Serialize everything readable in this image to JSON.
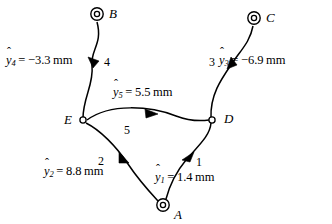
{
  "figure": {
    "background_color": "#ffffff",
    "stroke_color": "#000000",
    "width": 332,
    "height": 224
  },
  "nodes": [
    {
      "id": "B",
      "label": "B",
      "type": "ground-pivot",
      "x": 97,
      "y": 14
    },
    {
      "id": "C",
      "label": "C",
      "type": "ground-pivot",
      "x": 254,
      "y": 18
    },
    {
      "id": "E",
      "label": "E",
      "type": "pin-joint",
      "x": 83,
      "y": 120
    },
    {
      "id": "D",
      "label": "D",
      "type": "pin-joint",
      "x": 212,
      "y": 120
    },
    {
      "id": "A",
      "label": "A",
      "type": "ground-pivot",
      "x": 163,
      "y": 205
    }
  ],
  "links": [
    {
      "id": "link1",
      "number": "1",
      "from": "A",
      "to": "D",
      "value_label": {
        "var": "y",
        "sub": "1",
        "op": "=",
        "value": "1.4",
        "unit": "mm",
        "full": "y1 = 1.4 mm"
      }
    },
    {
      "id": "link2",
      "number": "2",
      "from": "A",
      "to": "E",
      "value_label": {
        "var": "y",
        "sub": "2",
        "op": "=",
        "value": "8.8",
        "unit": "mm",
        "full": "y2 = 8.8 mm"
      }
    },
    {
      "id": "link3",
      "number": "3",
      "from": "C",
      "to": "D",
      "value_label": {
        "var": "y",
        "sub": "3",
        "op": "=",
        "value": "−6.9",
        "unit": "mm",
        "full": "y3 = -6.9 mm"
      }
    },
    {
      "id": "link4",
      "number": "4",
      "from": "B",
      "to": "E",
      "value_label": {
        "var": "y",
        "sub": "4",
        "op": "=",
        "value": "−3.3",
        "unit": "mm",
        "full": "y4 = -3.3 mm"
      }
    },
    {
      "id": "link5",
      "number": "5",
      "from": "E",
      "to": "D",
      "value_label": {
        "var": "y",
        "sub": "5",
        "op": "=",
        "value": "5.5",
        "unit": "mm",
        "full": "y5 = 5.5 mm"
      }
    }
  ],
  "icons": {
    "ground_pivot": "double-circle-icon",
    "pin_joint": "open-circle-icon",
    "arrow": "arrowhead-icon"
  }
}
